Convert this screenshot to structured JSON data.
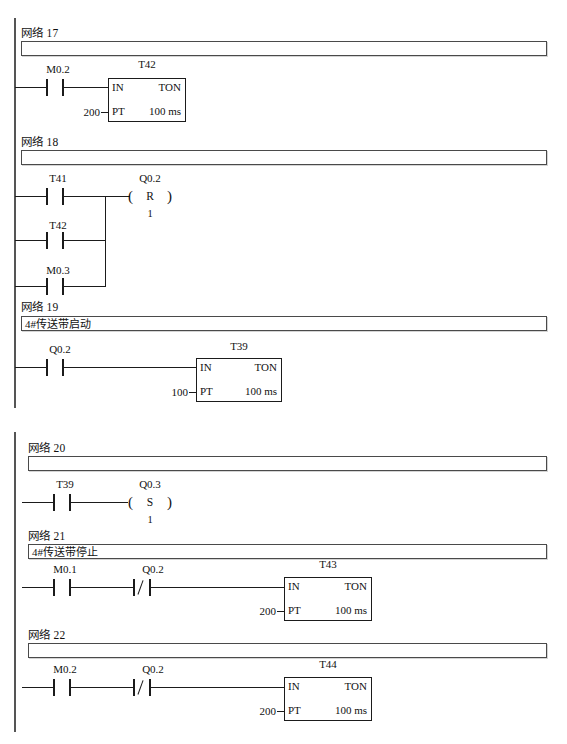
{
  "page": {
    "width": 567,
    "height": 744,
    "language": "zh-CN",
    "program_type": "ladder-logic",
    "network_word": "网络"
  },
  "networks": [
    {
      "id": "net17",
      "label": "网络 17",
      "comment": "",
      "rungs": [
        {
          "contacts": [
            {
              "name": "M0.2",
              "type": "NO"
            }
          ],
          "timer": {
            "name": "T42",
            "in": "IN",
            "mode": "TON",
            "pt_label": "PT",
            "pt_value": "200",
            "time_base": "100 ms"
          }
        }
      ]
    },
    {
      "id": "net18",
      "label": "网络 18",
      "comment": "",
      "rungs": [
        {
          "contacts": [
            {
              "name": "T41",
              "type": "NO"
            }
          ],
          "coil": {
            "name": "Q0.2",
            "op": "R",
            "paren_left": "(",
            "paren_right": ")",
            "count": "1"
          }
        },
        {
          "contacts": [
            {
              "name": "T42",
              "type": "NO"
            }
          ]
        },
        {
          "contacts": [
            {
              "name": "M0.3",
              "type": "NO"
            }
          ]
        }
      ]
    },
    {
      "id": "net19",
      "label": "网络 19",
      "comment": "4#传送带启动",
      "rungs": [
        {
          "contacts": [
            {
              "name": "Q0.2",
              "type": "NO"
            }
          ],
          "timer": {
            "name": "T39",
            "in": "IN",
            "mode": "TON",
            "pt_label": "PT",
            "pt_value": "100",
            "time_base": "100 ms"
          }
        }
      ]
    },
    {
      "id": "net20",
      "label": "网络 20",
      "comment": "",
      "rungs": [
        {
          "contacts": [
            {
              "name": "T39",
              "type": "NO"
            }
          ],
          "coil": {
            "name": "Q0.3",
            "op": "S",
            "paren_left": "(",
            "paren_right": ")",
            "count": "1"
          }
        }
      ]
    },
    {
      "id": "net21",
      "label": "网络 21",
      "comment": "4#传送带停止",
      "rungs": [
        {
          "contacts": [
            {
              "name": "M0.1",
              "type": "NO"
            },
            {
              "name": "Q0.2",
              "type": "NC"
            }
          ],
          "timer": {
            "name": "T43",
            "in": "IN",
            "mode": "TON",
            "pt_label": "PT",
            "pt_value": "200",
            "time_base": "100 ms"
          }
        }
      ]
    },
    {
      "id": "net22",
      "label": "网络 22",
      "comment": "",
      "rungs": [
        {
          "contacts": [
            {
              "name": "M0.2",
              "type": "NC-mixed"
            },
            {
              "name": "Q0.2",
              "type": "NC"
            }
          ],
          "timer": {
            "name": "T44",
            "in": "IN",
            "mode": "TON",
            "pt_label": "PT",
            "pt_value": "200",
            "time_base": "100 ms"
          }
        }
      ]
    }
  ],
  "colors": {
    "rail": "#555555",
    "wire": "#1b1b1b",
    "bar_border": "#4a4a4a",
    "background": "#ffffff"
  }
}
